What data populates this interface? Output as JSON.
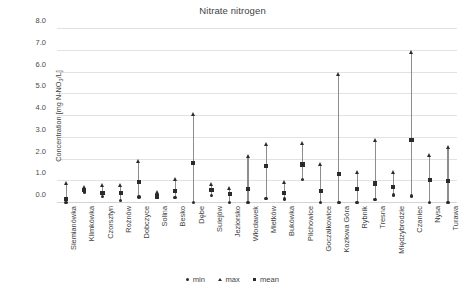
{
  "chart_data": {
    "type": "scatter",
    "title": "Nitrate nitrogen",
    "xlabel": "",
    "ylabel": "Concentration [mg N-NO3/L]",
    "ylabel_parts": {
      "prefix": "Concentration [mg N-NO",
      "sub": "3",
      "suffix": "/L]"
    },
    "ylim": [
      0.0,
      8.0
    ],
    "yticks": [
      "0.0",
      "1.0",
      "2.0",
      "3.0",
      "4.0",
      "5.0",
      "6.0",
      "7.0",
      "8.0"
    ],
    "ytick_values": [
      0,
      1,
      2,
      3,
      4,
      5,
      6,
      7,
      8
    ],
    "grid": true,
    "legend_position": "bottom",
    "legend": [
      {
        "name": "min",
        "marker": "circle"
      },
      {
        "name": "max",
        "marker": "triangle"
      },
      {
        "name": "mean",
        "marker": "square"
      }
    ],
    "categories": [
      "Siemianówka",
      "Klimkówka",
      "Czorsztyn",
      "Rożnów",
      "Dobczyce",
      "Solina",
      "Besko",
      "Dębe",
      "Sulejów",
      "Jeziorsko",
      "Włocławek",
      "Mietków",
      "Bukówka",
      "Pilchowice",
      "Goczałkowice",
      "Kozłowa Góra",
      "Rybnik",
      "Tresna",
      "Międzybrodzie",
      "Czaniec",
      "Nysa",
      "Turawa"
    ],
    "series": [
      {
        "name": "min",
        "values": [
          0.03,
          0.5,
          0.29,
          0.12,
          0.27,
          0.25,
          0.25,
          0.02,
          0.35,
          0.03,
          0.03,
          0.21,
          0.19,
          1.08,
          0.03,
          0.02,
          0.03,
          0.15,
          0.37,
          0.33,
          0.02,
          0.03
        ]
      },
      {
        "name": "mean",
        "values": [
          0.18,
          0.59,
          0.47,
          0.46,
          0.95,
          0.3,
          0.54,
          1.85,
          0.58,
          0.42,
          0.65,
          1.71,
          0.46,
          1.77,
          0.55,
          1.33,
          0.65,
          0.9,
          0.73,
          2.88,
          1.07,
          1.0
        ]
      },
      {
        "name": "max",
        "values": [
          0.88,
          0.7,
          0.79,
          0.8,
          1.9,
          0.48,
          1.07,
          4.05,
          0.83,
          0.67,
          2.15,
          2.68,
          0.95,
          2.73,
          1.77,
          5.9,
          1.38,
          2.87,
          1.38,
          6.92,
          2.18,
          2.55
        ]
      }
    ]
  }
}
